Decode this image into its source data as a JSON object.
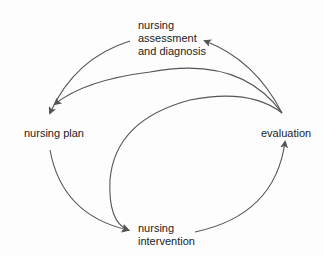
{
  "diagram": {
    "type": "nursing-process-cycle",
    "nodes": {
      "assessment": {
        "lines": [
          "nursing",
          "assessment",
          "and diagnosis"
        ]
      },
      "plan": {
        "lines": [
          "nursing plan"
        ]
      },
      "evaluation": {
        "lines": [
          "evaluation"
        ]
      },
      "intervention": {
        "lines": [
          "nursing",
          "intervention"
        ]
      }
    },
    "edges": [
      {
        "from": "evaluation",
        "to": "assessment"
      },
      {
        "from": "assessment",
        "to": "plan"
      },
      {
        "from": "evaluation",
        "to": "plan"
      },
      {
        "from": "evaluation",
        "to": "intervention"
      },
      {
        "from": "plan",
        "to": "intervention"
      },
      {
        "from": "intervention",
        "to": "evaluation"
      }
    ],
    "colors": {
      "line": "#555555",
      "text": "#222222"
    }
  }
}
